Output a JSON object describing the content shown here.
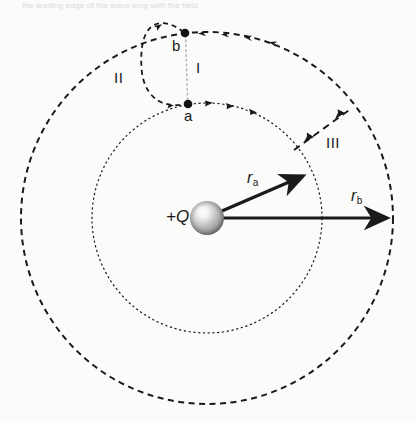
{
  "figure": {
    "title_bleed": "the leading edge of the wave long with the field",
    "background_color": "#fbfbfa",
    "ink_color": "#1a1a1a",
    "width": 416,
    "height": 422
  },
  "charge": {
    "label": "+Q",
    "center_x": 207,
    "center_y": 218,
    "radius": 17,
    "sphere_highlight_color": "#ffffff",
    "sphere_mid_color": "#b9b9b9",
    "sphere_edge_color": "#6e6e6e"
  },
  "circles": [
    {
      "name": "inner-equipotential",
      "label": "r_a",
      "radius": 115,
      "stroke": "#1a1a1a",
      "style": "dotted",
      "dasharray": "2.2 2.6",
      "width": 1.2
    },
    {
      "name": "outer-equipotential",
      "label": "r_b",
      "radius": 186,
      "stroke": "#1a1a1a",
      "style": "dashed",
      "dasharray": "6 4.5",
      "width": 2.0
    }
  ],
  "points": [
    {
      "id": "a",
      "label": "a",
      "x": 188,
      "y": 104,
      "label_x": 184,
      "label_y": 108
    },
    {
      "id": "b",
      "label": "b",
      "x": 185,
      "y": 33,
      "label_x": 172,
      "label_y": 38
    }
  ],
  "paths": [
    {
      "id": "I",
      "label": "I",
      "label_x": 196,
      "label_y": 60,
      "description": "radial dotted path from b to a",
      "color": "#b8b8b8"
    },
    {
      "id": "II",
      "label": "II",
      "label_x": 114,
      "label_y": 70,
      "description": "dashed loop bulging left from b to a",
      "color": "#1a1a1a"
    },
    {
      "id": "III",
      "label": "III",
      "label_x": 326,
      "label_y": 135,
      "description": "dashed radial path from inner to outer circle",
      "color": "#1a1a1a"
    }
  ],
  "vectors": [
    {
      "id": "r_a",
      "label_main": "r",
      "label_sub": "a",
      "label_x": 251,
      "label_y": 170,
      "from_x": 207,
      "from_y": 218,
      "to_x": 306,
      "to_y": 174
    },
    {
      "id": "r_b",
      "label_main": "r",
      "label_sub": "b",
      "label_x": 355,
      "label_y": 188,
      "from_x": 207,
      "from_y": 218,
      "to_x": 391,
      "to_y": 218
    }
  ]
}
